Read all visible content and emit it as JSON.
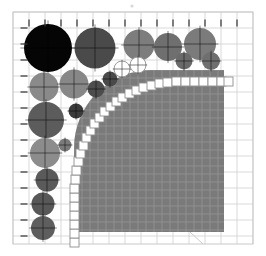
{
  "figure": {
    "title": "",
    "background_color": "#ffffff",
    "canvas": {
      "width": 266,
      "height": 256
    }
  },
  "grid": {
    "name": "background-grid",
    "x0": 13,
    "y0": 12,
    "x1": 253,
    "y1": 244,
    "cell_size": 16,
    "line_color": "#cfcfcf",
    "line_width": 0.8,
    "border_color": "#c8c8c8",
    "tick_color": "#333333",
    "tick_length": 7,
    "tick_spacing": 16,
    "tick_row_y": 23,
    "tick_col_x": 24
  },
  "marks": {
    "top_dot": {
      "x": 132,
      "y": 6,
      "r": 1.6,
      "color": "#d8d8d8"
    },
    "bottom_pointer": {
      "x1": 190,
      "y1": 232,
      "x2": 203,
      "y2": 244,
      "color": "#cccccc",
      "width": 1
    }
  },
  "shaded_region": {
    "name": "filled-quarter-region",
    "fill": "#7a7a7a",
    "grid_line_color": "#9a9a9a",
    "grid_cell": 8,
    "right": 224,
    "bottom": 232,
    "top": 70,
    "left": 74,
    "corner_radius": 78
  },
  "boundary_cells": {
    "name": "boundary-square-chain",
    "fill": "#ffffff",
    "stroke": "#8f8f8f",
    "stroke_width": 0.9,
    "size": 9,
    "count": 36,
    "squares": [
      [
        70,
        238
      ],
      [
        70,
        229
      ],
      [
        70,
        220
      ],
      [
        70,
        211
      ],
      [
        70,
        202
      ],
      [
        70,
        193
      ],
      [
        70,
        184
      ],
      [
        71,
        175
      ],
      [
        72,
        166
      ],
      [
        74,
        157
      ],
      [
        76,
        149
      ],
      [
        79,
        141
      ],
      [
        82,
        133
      ],
      [
        86,
        126
      ],
      [
        90,
        119
      ],
      [
        95,
        113
      ],
      [
        100,
        107
      ],
      [
        106,
        102
      ],
      [
        112,
        97
      ],
      [
        118,
        93
      ],
      [
        125,
        89
      ],
      [
        132,
        86
      ],
      [
        139,
        83
      ],
      [
        147,
        81
      ],
      [
        155,
        79
      ],
      [
        163,
        78
      ],
      [
        172,
        77
      ],
      [
        181,
        77
      ],
      [
        190,
        77
      ],
      [
        199,
        77
      ],
      [
        208,
        77
      ],
      [
        217,
        77
      ],
      [
        224,
        77
      ]
    ]
  },
  "circles": {
    "name": "data-circles",
    "crosshair_color": "#000000",
    "crosshair_opacity": 0.55,
    "items": [
      {
        "id": "c01",
        "cx": 48,
        "cy": 48,
        "r": 24.0,
        "color": "#050505",
        "filled": true,
        "stroke": "none"
      },
      {
        "id": "c02",
        "cx": 95,
        "cy": 48,
        "r": 20.5,
        "color": "#4a4a4a",
        "filled": true,
        "stroke": "none"
      },
      {
        "id": "c03",
        "cx": 139,
        "cy": 45,
        "r": 15.5,
        "color": "#7d7d7d",
        "filled": true,
        "stroke": "none"
      },
      {
        "id": "c04",
        "cx": 168,
        "cy": 47,
        "r": 14.0,
        "color": "#6f6f6f",
        "filled": true,
        "stroke": "none"
      },
      {
        "id": "c05",
        "cx": 200,
        "cy": 44,
        "r": 16.0,
        "color": "#7b7b7b",
        "filled": true,
        "stroke": "none"
      },
      {
        "id": "c06",
        "cx": 184,
        "cy": 61,
        "r": 8.5,
        "color": "#6a6a6a",
        "filled": true,
        "stroke": "none"
      },
      {
        "id": "c07",
        "cx": 211,
        "cy": 61,
        "r": 9.0,
        "color": "#6f6f6f",
        "filled": true,
        "stroke": "none"
      },
      {
        "id": "c08",
        "cx": 44,
        "cy": 87,
        "r": 14.5,
        "color": "#8a8a8a",
        "filled": true,
        "stroke": "none"
      },
      {
        "id": "c09",
        "cx": 74,
        "cy": 84,
        "r": 14.5,
        "color": "#878787",
        "filled": true,
        "stroke": "none"
      },
      {
        "id": "c10",
        "cx": 96,
        "cy": 89,
        "r": 8.5,
        "color": "#4d4d4d",
        "filled": true,
        "stroke": "none"
      },
      {
        "id": "c11",
        "cx": 110,
        "cy": 79,
        "r": 7.5,
        "color": "#4a4a4a",
        "filled": true,
        "stroke": "none"
      },
      {
        "id": "c12",
        "cx": 122,
        "cy": 69,
        "r": 8.0,
        "color": "#ffffff",
        "filled": false,
        "stroke": "#9a9a9a"
      },
      {
        "id": "c13",
        "cx": 138,
        "cy": 65,
        "r": 8.0,
        "color": "#ffffff",
        "filled": false,
        "stroke": "#9a9a9a"
      },
      {
        "id": "c14",
        "cx": 46,
        "cy": 120,
        "r": 18.0,
        "color": "#5c5c5c",
        "filled": true,
        "stroke": "none"
      },
      {
        "id": "c15",
        "cx": 76,
        "cy": 111,
        "r": 7.5,
        "color": "#3b3b3b",
        "filled": true,
        "stroke": "none"
      },
      {
        "id": "c16",
        "cx": 45,
        "cy": 153,
        "r": 15.0,
        "color": "#8c8c8c",
        "filled": true,
        "stroke": "none"
      },
      {
        "id": "c17",
        "cx": 65,
        "cy": 145,
        "r": 6.5,
        "color": "#7a7a7a",
        "filled": true,
        "stroke": "none"
      },
      {
        "id": "c18",
        "cx": 47,
        "cy": 180,
        "r": 11.5,
        "color": "#5a5a5a",
        "filled": true,
        "stroke": "none"
      },
      {
        "id": "c19",
        "cx": 43,
        "cy": 204,
        "r": 11.5,
        "color": "#585858",
        "filled": true,
        "stroke": "none"
      },
      {
        "id": "c20",
        "cx": 43,
        "cy": 228,
        "r": 12.0,
        "color": "#5e5e5e",
        "filled": true,
        "stroke": "none"
      }
    ]
  }
}
